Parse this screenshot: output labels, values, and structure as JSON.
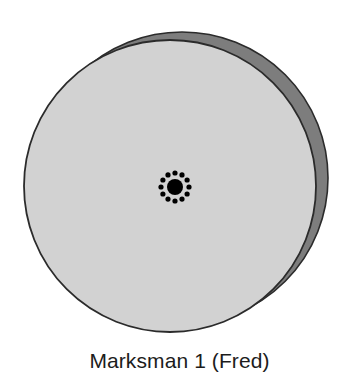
{
  "figure": {
    "caption": "Marksman 1 (Fred)",
    "background_color": "#ffffff"
  },
  "target": {
    "name": "shooting-target-disc",
    "face_color": "#d2d2d2",
    "edge_band_color": "#7d7d7d",
    "outline_color": "#2b2b2b",
    "face": {
      "cx": 170,
      "cy": 186,
      "r": 146
    },
    "back": {
      "cx": 182,
      "cy": 178,
      "r": 146
    }
  },
  "shot_group": {
    "name": "bullet-hole-cluster",
    "color": "#000000",
    "center": {
      "x": 175,
      "y": 187
    },
    "center_hole_radius": 8,
    "ring_radius": 14,
    "satellite_radius": 2.6,
    "satellite_count": 12,
    "satellites": [
      {
        "x": 175.0,
        "y": 173.0
      },
      {
        "x": 182.0,
        "y": 174.9
      },
      {
        "x": 187.1,
        "y": 180.0
      },
      {
        "x": 189.0,
        "y": 187.0
      },
      {
        "x": 187.1,
        "y": 194.0
      },
      {
        "x": 182.0,
        "y": 199.1
      },
      {
        "x": 175.0,
        "y": 201.0
      },
      {
        "x": 168.0,
        "y": 199.1
      },
      {
        "x": 162.9,
        "y": 194.0
      },
      {
        "x": 161.0,
        "y": 187.0
      },
      {
        "x": 162.9,
        "y": 180.0
      },
      {
        "x": 168.0,
        "y": 174.9
      }
    ]
  }
}
